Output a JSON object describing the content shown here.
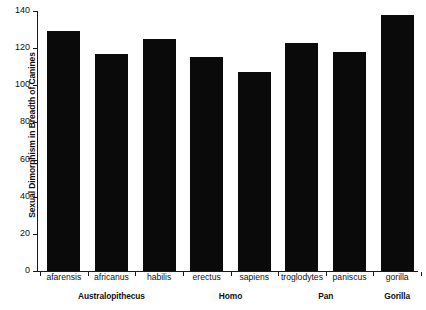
{
  "chart_data": {
    "type": "bar",
    "title": "",
    "xlabel": "",
    "ylabel": "Sexual Dimorphism in Breadth of Canines",
    "ylim": [
      0,
      140
    ],
    "yticks": [
      0,
      20,
      40,
      60,
      80,
      100,
      120,
      140
    ],
    "grid": false,
    "legend": null,
    "bar_color": "#0a0a0a",
    "categories": [
      "afarensis",
      "africanus",
      "habilis",
      "erectus",
      "sapiens",
      "troglodytes",
      "paniscus",
      "gorilla"
    ],
    "values": [
      129,
      117,
      125,
      115,
      107,
      123,
      118,
      138
    ],
    "groups": [
      {
        "label": "Australopithecus",
        "members": [
          "afarensis",
          "africanus",
          "habilis"
        ]
      },
      {
        "label": "Homo",
        "members": [
          "erectus",
          "sapiens"
        ]
      },
      {
        "label": "Pan",
        "members": [
          "troglodytes",
          "paniscus"
        ]
      },
      {
        "label": "Gorilla",
        "members": [
          "gorilla"
        ]
      }
    ]
  }
}
